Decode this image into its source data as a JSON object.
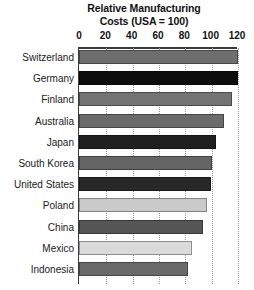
{
  "chart_data": {
    "type": "bar",
    "orientation": "horizontal",
    "title": "Relative Manufacturing Costs (USA = 100)",
    "title_lines": [
      "Relative Manufacturing",
      "Costs (USA = 100)"
    ],
    "xlabel": "",
    "ylabel": "",
    "xlim": [
      0,
      120
    ],
    "xticks": [
      0,
      20,
      40,
      60,
      80,
      100,
      120
    ],
    "xtick_labels": [
      "0",
      "20",
      "40",
      "60",
      "80",
      "100",
      "120"
    ],
    "grid": "vertical dotted gridlines at each x tick",
    "legend": "none",
    "categories": [
      "Switzerland",
      "Germany",
      "Finland",
      "Australia",
      "Japan",
      "South Korea",
      "United States",
      "Poland",
      "China",
      "Mexico",
      "Indonesia"
    ],
    "values": [
      121,
      121,
      116,
      110,
      104,
      101,
      100,
      97,
      94,
      86,
      83
    ],
    "bar_colors": [
      "#6e6e6e",
      "#0d0d0d",
      "#737373",
      "#6b6b6b",
      "#1f1f1f",
      "#646464",
      "#282828",
      "#cacaca",
      "#565656",
      "#dadada",
      "#6a6a6a"
    ]
  },
  "axis": {
    "line_color": "#3a3a3a",
    "gridline_color": "#9a9a9a"
  }
}
